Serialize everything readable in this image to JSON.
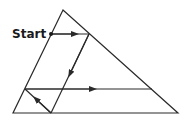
{
  "diagram": {
    "start_label": "Start",
    "colors": {
      "line": "#2a2a2a",
      "background": "#ffffff"
    },
    "triangle": {
      "apex": [
        63,
        10
      ],
      "bottom_left": [
        13,
        113
      ],
      "bottom_right": [
        178,
        113
      ]
    },
    "path": [
      {
        "from": [
          51,
          34
        ],
        "to": [
          89,
          34
        ],
        "direction": "right"
      },
      {
        "from": [
          89,
          34
        ],
        "to": [
          51,
          113
        ],
        "direction": "down-left"
      },
      {
        "from": [
          51,
          113
        ],
        "to": [
          25,
          89
        ],
        "direction": "up-left"
      },
      {
        "from": [
          25,
          89
        ],
        "to": [
          152,
          89
        ],
        "direction": "right"
      }
    ]
  }
}
